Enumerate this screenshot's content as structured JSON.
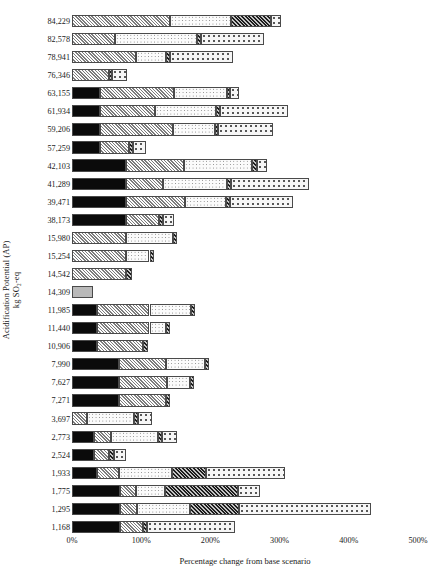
{
  "chart_data": {
    "type": "bar",
    "orientation": "horizontal",
    "stacked": true,
    "title": "",
    "xlabel": "Percentage change from base scenario",
    "ylabel": "Acidification Potential (AP)",
    "ylabel_line2": "kg SO₂-eq",
    "xlim": [
      0,
      500
    ],
    "xticks": [
      0,
      100,
      200,
      300,
      400,
      500
    ],
    "xticklabels": [
      "0%",
      "100%",
      "200%",
      "300%",
      "400%",
      "500%"
    ],
    "grid": false,
    "legend": "none",
    "unit": "%",
    "series": [
      {
        "name": "segment-1",
        "pattern": "black-dotted",
        "color": "#0b0b0b"
      },
      {
        "name": "segment-2",
        "pattern": "light-diagonal-hatch",
        "color": "#d2d2d2"
      },
      {
        "name": "segment-3",
        "pattern": "fine-dots",
        "color": "#fbfbfb"
      },
      {
        "name": "segment-4",
        "pattern": "dark-diagonal-hatch",
        "color": "#6e6e6e"
      },
      {
        "name": "segment-5",
        "pattern": "coarse-dots",
        "color": "#f6f6f6"
      },
      {
        "name": "base",
        "pattern": "solid-gray",
        "color": "#b9b9b9"
      }
    ],
    "categories": [
      "84,229",
      "82,578",
      "78,941",
      "76,346",
      "63,155",
      "61,934",
      "59,206",
      "57,259",
      "42,103",
      "41,289",
      "39,471",
      "38,173",
      "15,980",
      "15,254",
      "14,542",
      "14,309",
      "11,985",
      "11,440",
      "10,906",
      "7,990",
      "7,627",
      "7,271",
      "3,697",
      "2,773",
      "2,524",
      "1,933",
      "1,775",
      "1,295",
      "1,168"
    ],
    "rows": [
      {
        "label": "84,229",
        "total": 302,
        "segments": [
          {
            "s": "segment-2",
            "v": 142
          },
          {
            "s": "segment-3",
            "v": 88
          },
          {
            "s": "segment-4",
            "v": 58
          },
          {
            "s": "segment-5",
            "v": 14
          }
        ]
      },
      {
        "label": "82,578",
        "total": 278,
        "segments": [
          {
            "s": "segment-2",
            "v": 62
          },
          {
            "s": "segment-3",
            "v": 118
          },
          {
            "s": "segment-4",
            "v": 6
          },
          {
            "s": "segment-5",
            "v": 92
          }
        ]
      },
      {
        "label": "78,941",
        "total": 232,
        "segments": [
          {
            "s": "segment-2",
            "v": 92
          },
          {
            "s": "segment-3",
            "v": 44
          },
          {
            "s": "segment-4",
            "v": 6
          },
          {
            "s": "segment-5",
            "v": 90
          }
        ]
      },
      {
        "label": "76,346",
        "total": 80,
        "segments": [
          {
            "s": "segment-2",
            "v": 54
          },
          {
            "s": "segment-4",
            "v": 4
          },
          {
            "s": "segment-5",
            "v": 22
          }
        ]
      },
      {
        "label": "63,155",
        "total": 242,
        "segments": [
          {
            "s": "segment-1",
            "v": 40
          },
          {
            "s": "segment-2",
            "v": 108
          },
          {
            "s": "segment-3",
            "v": 76
          },
          {
            "s": "segment-4",
            "v": 5
          },
          {
            "s": "segment-5",
            "v": 13
          }
        ]
      },
      {
        "label": "61,934",
        "total": 312,
        "segments": [
          {
            "s": "segment-1",
            "v": 40
          },
          {
            "s": "segment-2",
            "v": 80
          },
          {
            "s": "segment-3",
            "v": 88
          },
          {
            "s": "segment-4",
            "v": 6
          },
          {
            "s": "segment-5",
            "v": 98
          }
        ]
      },
      {
        "label": "59,206",
        "total": 290,
        "segments": [
          {
            "s": "segment-1",
            "v": 40
          },
          {
            "s": "segment-2",
            "v": 106
          },
          {
            "s": "segment-3",
            "v": 60
          },
          {
            "s": "segment-4",
            "v": 5
          },
          {
            "s": "segment-5",
            "v": 79
          }
        ]
      },
      {
        "label": "57,259",
        "total": 107,
        "segments": [
          {
            "s": "segment-1",
            "v": 40
          },
          {
            "s": "segment-2",
            "v": 42
          },
          {
            "s": "segment-4",
            "v": 6
          },
          {
            "s": "segment-5",
            "v": 19
          }
        ]
      },
      {
        "label": "42,103",
        "total": 282,
        "segments": [
          {
            "s": "segment-1",
            "v": 78
          },
          {
            "s": "segment-2",
            "v": 84
          },
          {
            "s": "segment-3",
            "v": 98
          },
          {
            "s": "segment-4",
            "v": 7
          },
          {
            "s": "segment-5",
            "v": 15
          }
        ]
      },
      {
        "label": "41,289",
        "total": 342,
        "segments": [
          {
            "s": "segment-1",
            "v": 78
          },
          {
            "s": "segment-2",
            "v": 54
          },
          {
            "s": "segment-3",
            "v": 92
          },
          {
            "s": "segment-4",
            "v": 6
          },
          {
            "s": "segment-5",
            "v": 112
          }
        ]
      },
      {
        "label": "39,471",
        "total": 320,
        "segments": [
          {
            "s": "segment-1",
            "v": 78
          },
          {
            "s": "segment-2",
            "v": 86
          },
          {
            "s": "segment-3",
            "v": 58
          },
          {
            "s": "segment-4",
            "v": 6
          },
          {
            "s": "segment-5",
            "v": 92
          }
        ]
      },
      {
        "label": "38,173",
        "total": 148,
        "segments": [
          {
            "s": "segment-1",
            "v": 78
          },
          {
            "s": "segment-2",
            "v": 48
          },
          {
            "s": "segment-4",
            "v": 6
          },
          {
            "s": "segment-5",
            "v": 16
          }
        ]
      },
      {
        "label": "15,980",
        "total": 152,
        "segments": [
          {
            "s": "segment-2",
            "v": 78
          },
          {
            "s": "segment-3",
            "v": 68
          },
          {
            "s": "segment-4",
            "v": 6
          }
        ]
      },
      {
        "label": "15,254",
        "total": 118,
        "segments": [
          {
            "s": "segment-2",
            "v": 78
          },
          {
            "s": "segment-3",
            "v": 34
          },
          {
            "s": "segment-4",
            "v": 6
          }
        ]
      },
      {
        "label": "14,542",
        "total": 86,
        "segments": [
          {
            "s": "segment-2",
            "v": 78
          },
          {
            "s": "segment-4",
            "v": 8
          }
        ]
      },
      {
        "label": "14,309",
        "total": 30,
        "segments": [
          {
            "s": "base",
            "v": 30
          }
        ]
      },
      {
        "label": "11,985",
        "total": 178,
        "segments": [
          {
            "s": "segment-1",
            "v": 36
          },
          {
            "s": "segment-2",
            "v": 76
          },
          {
            "s": "segment-3",
            "v": 60
          },
          {
            "s": "segment-4",
            "v": 6
          }
        ]
      },
      {
        "label": "11,440",
        "total": 142,
        "segments": [
          {
            "s": "segment-1",
            "v": 36
          },
          {
            "s": "segment-2",
            "v": 76
          },
          {
            "s": "segment-3",
            "v": 24
          },
          {
            "s": "segment-4",
            "v": 6
          }
        ]
      },
      {
        "label": "10,906",
        "total": 110,
        "segments": [
          {
            "s": "segment-1",
            "v": 36
          },
          {
            "s": "segment-2",
            "v": 66
          },
          {
            "s": "segment-4",
            "v": 8
          }
        ]
      },
      {
        "label": "7,990",
        "total": 198,
        "segments": [
          {
            "s": "segment-1",
            "v": 68
          },
          {
            "s": "segment-2",
            "v": 68
          },
          {
            "s": "segment-3",
            "v": 56
          },
          {
            "s": "segment-4",
            "v": 6
          }
        ]
      },
      {
        "label": "7,627",
        "total": 176,
        "segments": [
          {
            "s": "segment-1",
            "v": 68
          },
          {
            "s": "segment-2",
            "v": 70
          },
          {
            "s": "segment-3",
            "v": 32
          },
          {
            "s": "segment-4",
            "v": 6
          }
        ]
      },
      {
        "label": "7,271",
        "total": 142,
        "segments": [
          {
            "s": "segment-1",
            "v": 68
          },
          {
            "s": "segment-2",
            "v": 68
          },
          {
            "s": "segment-4",
            "v": 6
          }
        ]
      },
      {
        "label": "3,697",
        "total": 116,
        "segments": [
          {
            "s": "segment-2",
            "v": 22
          },
          {
            "s": "segment-3",
            "v": 68
          },
          {
            "s": "segment-4",
            "v": 6
          },
          {
            "s": "segment-5",
            "v": 20
          }
        ]
      },
      {
        "label": "2,773",
        "total": 152,
        "segments": [
          {
            "s": "segment-1",
            "v": 32
          },
          {
            "s": "segment-2",
            "v": 24
          },
          {
            "s": "segment-3",
            "v": 68
          },
          {
            "s": "segment-4",
            "v": 6
          },
          {
            "s": "segment-5",
            "v": 22
          }
        ]
      },
      {
        "label": "2,524",
        "total": 78,
        "segments": [
          {
            "s": "segment-1",
            "v": 32
          },
          {
            "s": "segment-2",
            "v": 22
          },
          {
            "s": "segment-4",
            "v": 6
          },
          {
            "s": "segment-5",
            "v": 18
          }
        ]
      },
      {
        "label": "1,933",
        "total": 308,
        "segments": [
          {
            "s": "segment-1",
            "v": 36
          },
          {
            "s": "segment-2",
            "v": 32
          },
          {
            "s": "segment-3",
            "v": 76
          },
          {
            "s": "segment-4",
            "v": 50
          },
          {
            "s": "segment-5",
            "v": 114
          }
        ]
      },
      {
        "label": "1,775",
        "total": 272,
        "segments": [
          {
            "s": "segment-1",
            "v": 70
          },
          {
            "s": "segment-2",
            "v": 22
          },
          {
            "s": "segment-3",
            "v": 42
          },
          {
            "s": "segment-4",
            "v": 106
          },
          {
            "s": "segment-5",
            "v": 32
          }
        ]
      },
      {
        "label": "1,295",
        "total": 432,
        "segments": [
          {
            "s": "segment-1",
            "v": 70
          },
          {
            "s": "segment-2",
            "v": 24
          },
          {
            "s": "segment-3",
            "v": 76
          },
          {
            "s": "segment-4",
            "v": 72
          },
          {
            "s": "segment-5",
            "v": 190
          }
        ]
      },
      {
        "label": "1,168",
        "total": 236,
        "segments": [
          {
            "s": "segment-1",
            "v": 70
          },
          {
            "s": "segment-2",
            "v": 32
          },
          {
            "s": "segment-4",
            "v": 6
          },
          {
            "s": "segment-5",
            "v": 128
          }
        ]
      }
    ]
  }
}
